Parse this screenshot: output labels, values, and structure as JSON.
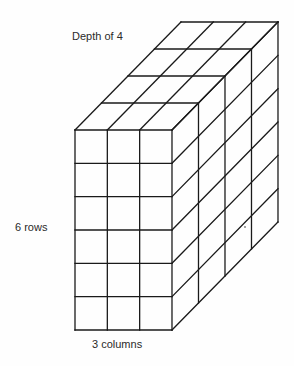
{
  "diagram": {
    "type": "rectangular-prism-of-unit-cubes",
    "labels": {
      "depth": "Depth of 4",
      "rows": "6 rows",
      "columns": "3 columns"
    },
    "dimensions": {
      "columns": 3,
      "rows": 6,
      "depth": 4
    },
    "geometry": {
      "front_left": 75,
      "front_top": 130,
      "cell_w": 32.33,
      "cell_h": 33.33,
      "depth_dx": 26.5,
      "depth_dy": -27
    },
    "colors": {
      "line": "#1a1a1a",
      "text": "#2a2a2a",
      "background": "#fefefe"
    }
  }
}
